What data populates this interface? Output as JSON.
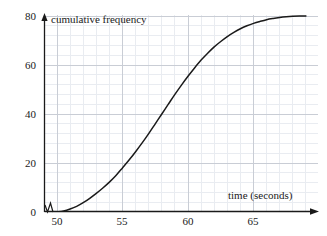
{
  "chart_data": {
    "type": "line",
    "title": "",
    "subtitle": "",
    "xlabel": "time (seconds)",
    "ylabel": "cumulative frequency",
    "xlim": [
      49,
      69
    ],
    "ylim": [
      0,
      80
    ],
    "xticks": [
      50,
      55,
      60,
      65
    ],
    "yticks": [
      0,
      20,
      40,
      60,
      80
    ],
    "xtick_labels": [
      "50",
      "55",
      "60",
      "65"
    ],
    "ytick_labels": [
      "0",
      "20",
      "40",
      "60",
      "80"
    ],
    "grid": true,
    "grid_major_color": "#c8ccd4",
    "grid_minor_color": "#e8ebf0",
    "legend": false,
    "legend_position": "none",
    "axis_break_x": true,
    "series": [
      {
        "name": "cumulative frequency",
        "color": "#1a1a1a",
        "x": [
          50.0,
          50.5,
          51.0,
          51.5,
          52.0,
          52.5,
          53.0,
          53.5,
          54.0,
          54.5,
          55.0,
          55.5,
          56.0,
          56.5,
          57.0,
          57.5,
          58.0,
          58.5,
          59.0,
          59.5,
          60.0,
          60.5,
          61.0,
          61.5,
          62.0,
          62.5,
          63.0,
          63.5,
          64.0,
          64.5,
          65.0,
          65.5,
          66.0,
          66.5,
          67.0,
          67.5,
          68.0,
          68.5,
          69.0
        ],
        "y": [
          0.0,
          0.4,
          1.2,
          2.3,
          3.8,
          5.6,
          7.6,
          9.8,
          12.2,
          14.9,
          18.0,
          21.2,
          24.6,
          28.2,
          32.0,
          36.0,
          40.0,
          44.0,
          48.0,
          51.8,
          55.4,
          58.8,
          62.0,
          64.8,
          67.4,
          69.6,
          71.6,
          73.3,
          74.8,
          76.0,
          77.0,
          77.8,
          78.5,
          79.0,
          79.4,
          79.7,
          79.9,
          80.0,
          80.0
        ]
      }
    ],
    "annotations": [
      {
        "name": "x-axis-arrow",
        "text": ""
      },
      {
        "name": "y-axis-arrow",
        "text": ""
      }
    ]
  }
}
